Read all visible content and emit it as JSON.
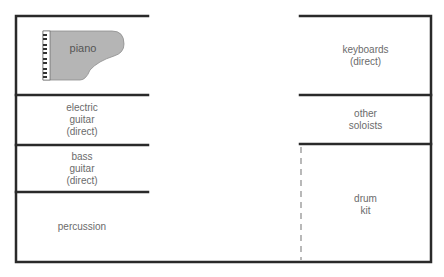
{
  "diagram": {
    "title": "",
    "colors": {
      "line": "#2a2a2a",
      "text": "#6b6b6b",
      "piano_fill": "#b5b5b5",
      "dashed": "#8a8a8a"
    },
    "left_zones": [
      {
        "id": "piano",
        "label": "piano"
      },
      {
        "id": "electric-guitar",
        "label": "electric\nguitar\n(direct)"
      },
      {
        "id": "bass-guitar",
        "label": "bass\nguitar\n(direct)"
      },
      {
        "id": "percussion",
        "label": "percussion"
      }
    ],
    "right_zones": [
      {
        "id": "keyboards",
        "label": "keyboards\n(direct)"
      },
      {
        "id": "other-soloists",
        "label": "other\nsoloists"
      },
      {
        "id": "drum-kit",
        "label": "drum\nkit"
      }
    ],
    "piano_icon": "grand-piano-icon"
  }
}
